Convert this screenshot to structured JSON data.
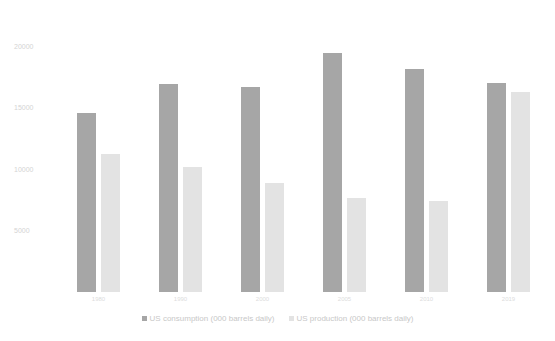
{
  "chart_data": {
    "type": "bar",
    "title": "",
    "xlabel": "",
    "ylabel": "",
    "categories": [
      "1980",
      "1990",
      "2000",
      "2005",
      "2010",
      "2019"
    ],
    "series": [
      {
        "name": "US consumption (000 barrels daily)",
        "color": "#a6a6a6",
        "values": [
          14600,
          16980,
          16730,
          19510,
          18200,
          17060
        ]
      },
      {
        "name": "US production (000 barrels daily)",
        "color": "#e3e3e3",
        "values": [
          11270,
          10200,
          8900,
          7670,
          7430,
          16330
        ]
      }
    ],
    "yticks": [
      "5000",
      "10000",
      "15000",
      "20000"
    ],
    "ylim": [
      0,
      20000
    ],
    "grid": false,
    "legend_position": "bottom"
  },
  "legend": {
    "items": [
      {
        "label": "US consumption (000 barrels daily)",
        "color": "#a6a6a6"
      },
      {
        "label": "US production (000 barrels daily)",
        "color": "#e3e3e3"
      }
    ]
  }
}
